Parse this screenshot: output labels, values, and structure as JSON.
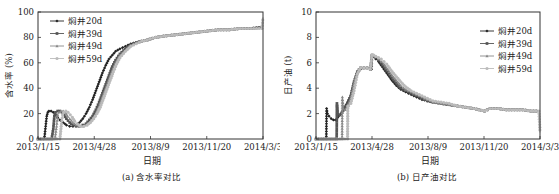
{
  "chart_data": [
    {
      "id": "a",
      "type": "line",
      "title": "(a) 含水率对比",
      "xlabel": "日期",
      "ylabel": "含水率 (%)",
      "x_ticks": [
        "2013/1/15",
        "2013/4/28",
        "2013/8/9",
        "2013/11/20",
        "2014/3/3"
      ],
      "x_tick_days": [
        0,
        103,
        206,
        309,
        412
      ],
      "xlim_days": [
        0,
        412
      ],
      "ylim": [
        0,
        100
      ],
      "y_ticks": [
        0,
        20,
        40,
        60,
        80,
        100
      ],
      "grid": false,
      "legend_position": "upper-left",
      "x_unit": "days since 2013/1/15",
      "series": [
        {
          "name": "焖井20d",
          "color": "#222222",
          "marker": "diamond",
          "x": [
            0,
            10,
            12,
            14,
            16,
            18,
            20,
            24,
            28,
            32,
            36,
            40,
            46,
            52,
            58,
            64,
            70,
            76,
            82,
            88,
            94,
            100,
            106,
            112,
            118,
            124,
            130,
            136,
            142,
            150,
            160,
            170,
            180,
            190,
            200,
            215,
            230,
            250,
            270,
            290,
            310,
            330,
            350,
            370,
            390,
            410
          ],
          "y": [
            0,
            0,
            2,
            10,
            18,
            21,
            22,
            22,
            21,
            19,
            17,
            15,
            13,
            11,
            10,
            10,
            11,
            13,
            16,
            20,
            25,
            31,
            38,
            45,
            52,
            58,
            63,
            66,
            69,
            71,
            73,
            75,
            76,
            77,
            78,
            80,
            81,
            82,
            83,
            84,
            85,
            86,
            86,
            87,
            87,
            88
          ]
        },
        {
          "name": "焖井39d",
          "color": "#555555",
          "marker": "square",
          "x": [
            0,
            25,
            28,
            30,
            32,
            36,
            40,
            44,
            48,
            52,
            58,
            64,
            70,
            76,
            82,
            88,
            94,
            100,
            106,
            112,
            118,
            124,
            130,
            136,
            142,
            150,
            160,
            170,
            180,
            190,
            200,
            215,
            230,
            250,
            270,
            290,
            310,
            330,
            350,
            370,
            390,
            410
          ],
          "y": [
            0,
            0,
            8,
            18,
            21,
            22,
            22,
            21,
            19,
            16,
            13,
            11,
            10,
            10,
            11,
            12,
            15,
            18,
            23,
            29,
            36,
            43,
            50,
            57,
            62,
            67,
            71,
            74,
            76,
            77,
            78,
            80,
            81,
            82,
            83,
            84,
            85,
            86,
            86,
            87,
            87,
            88
          ]
        },
        {
          "name": "焖井49d",
          "color": "#888888",
          "marker": "triangle",
          "x": [
            0,
            31,
            34,
            36,
            38,
            42,
            46,
            50,
            54,
            58,
            64,
            70,
            76,
            82,
            88,
            94,
            100,
            106,
            112,
            118,
            124,
            130,
            136,
            142,
            150,
            160,
            170,
            180,
            190,
            200,
            215,
            230,
            250,
            270,
            290,
            310,
            330,
            350,
            370,
            390,
            410
          ],
          "y": [
            0,
            0,
            10,
            19,
            21,
            22,
            22,
            21,
            18,
            16,
            13,
            11,
            10,
            10,
            11,
            13,
            16,
            20,
            26,
            33,
            40,
            47,
            54,
            60,
            66,
            70,
            74,
            76,
            77,
            78,
            80,
            81,
            82,
            83,
            84,
            85,
            86,
            86,
            87,
            87,
            88
          ]
        },
        {
          "name": "焖井59d",
          "color": "#bbbbbb",
          "marker": "circle",
          "x": [
            0,
            40,
            43,
            45,
            47,
            51,
            55,
            59,
            63,
            67,
            72,
            78,
            84,
            90,
            96,
            102,
            108,
            114,
            120,
            126,
            132,
            138,
            144,
            150,
            160,
            170,
            180,
            190,
            200,
            215,
            230,
            250,
            270,
            290,
            310,
            330,
            350,
            370,
            390,
            410,
            412
          ],
          "y": [
            0,
            0,
            12,
            19,
            21,
            22,
            21,
            19,
            17,
            14,
            12,
            10,
            10,
            11,
            13,
            16,
            20,
            25,
            32,
            39,
            46,
            53,
            59,
            64,
            69,
            73,
            75,
            77,
            78,
            80,
            81,
            82,
            83,
            84,
            85,
            86,
            86,
            87,
            87,
            87,
            96
          ]
        }
      ]
    },
    {
      "id": "b",
      "type": "line",
      "title": "(b) 日产油对比",
      "xlabel": "日期",
      "ylabel": "日产油 (t)",
      "x_ticks": [
        "2013/1/15",
        "2013/4/28",
        "2013/8/9",
        "2013/11/20",
        "2014/3/3"
      ],
      "x_tick_days": [
        0,
        103,
        206,
        309,
        412
      ],
      "xlim_days": [
        0,
        412
      ],
      "ylim": [
        0,
        10
      ],
      "y_ticks": [
        0,
        2,
        4,
        6,
        8,
        10
      ],
      "grid": false,
      "legend_position": "upper-right",
      "x_unit": "days since 2013/1/15",
      "series": [
        {
          "name": "焖井20d",
          "color": "#222222",
          "marker": "diamond",
          "x": [
            0,
            19,
            19.5,
            21,
            24,
            28,
            32,
            36,
            40,
            46,
            52,
            58,
            64,
            70,
            76,
            82,
            88,
            94,
            100,
            102,
            103,
            106,
            110,
            115,
            120,
            125,
            130,
            135,
            140,
            148,
            156,
            165,
            175,
            185,
            195,
            205,
            215,
            230,
            245,
            260,
            275,
            290,
            300,
            310,
            320,
            335,
            350,
            365,
            380,
            395,
            410
          ],
          "y": [
            0,
            0,
            2.4,
            2.0,
            1.8,
            1.6,
            1.5,
            1.5,
            1.7,
            2.0,
            2.4,
            2.9,
            3.4,
            4.4,
            5.2,
            5.5,
            5.6,
            5.6,
            5.5,
            5.5,
            6.6,
            6.5,
            6.3,
            6.1,
            5.8,
            5.5,
            5.2,
            4.9,
            4.6,
            4.2,
            3.9,
            3.7,
            3.5,
            3.3,
            3.1,
            3.0,
            2.9,
            2.8,
            2.7,
            2.6,
            2.5,
            2.4,
            2.3,
            2.2,
            2.4,
            2.4,
            2.3,
            2.3,
            2.3,
            2.2,
            2.2
          ]
        },
        {
          "name": "焖井39d",
          "color": "#555555",
          "marker": "square",
          "x": [
            0,
            38,
            38.5,
            40,
            44,
            48,
            52,
            58,
            64,
            70,
            76,
            82,
            88,
            94,
            100,
            103,
            106,
            110,
            115,
            120,
            125,
            130,
            135,
            140,
            148,
            156,
            165,
            175,
            185,
            195,
            205,
            215,
            230,
            245,
            260,
            275,
            290,
            300,
            310,
            320,
            335,
            350,
            365,
            380,
            395,
            410
          ],
          "y": [
            0,
            0,
            2.8,
            2.0,
            1.9,
            2.1,
            2.4,
            2.8,
            3.4,
            4.5,
            5.3,
            5.6,
            5.6,
            5.6,
            5.5,
            6.6,
            6.5,
            6.4,
            6.2,
            6.0,
            5.7,
            5.4,
            5.1,
            4.8,
            4.4,
            4.0,
            3.8,
            3.6,
            3.4,
            3.2,
            3.0,
            2.9,
            2.8,
            2.7,
            2.6,
            2.5,
            2.4,
            2.3,
            2.2,
            2.4,
            2.4,
            2.3,
            2.3,
            2.3,
            2.2,
            2.2
          ]
        },
        {
          "name": "焖井49d",
          "color": "#888888",
          "marker": "triangle",
          "x": [
            0,
            48,
            48.5,
            50,
            54,
            58,
            64,
            70,
            76,
            82,
            88,
            94,
            100,
            103,
            106,
            110,
            115,
            120,
            125,
            130,
            135,
            140,
            148,
            156,
            165,
            175,
            185,
            195,
            205,
            215,
            230,
            245,
            260,
            275,
            290,
            300,
            310,
            320,
            335,
            350,
            365,
            380,
            395,
            410
          ],
          "y": [
            0,
            0,
            3.3,
            2.4,
            2.3,
            2.6,
            3.2,
            4.4,
            5.3,
            5.6,
            5.6,
            5.6,
            5.5,
            6.6,
            6.6,
            6.5,
            6.3,
            6.1,
            5.9,
            5.6,
            5.3,
            5.0,
            4.6,
            4.2,
            3.9,
            3.7,
            3.5,
            3.3,
            3.1,
            2.9,
            2.8,
            2.7,
            2.6,
            2.5,
            2.4,
            2.3,
            2.2,
            2.4,
            2.4,
            2.3,
            2.3,
            2.3,
            2.2,
            2.2
          ]
        },
        {
          "name": "焖井59d",
          "color": "#bbbbbb",
          "marker": "circle",
          "x": [
            0,
            58,
            58.5,
            60,
            64,
            70,
            76,
            82,
            88,
            94,
            100,
            103,
            106,
            110,
            115,
            120,
            125,
            130,
            135,
            140,
            148,
            156,
            165,
            175,
            185,
            195,
            205,
            215,
            230,
            245,
            260,
            275,
            290,
            300,
            310,
            320,
            335,
            350,
            365,
            380,
            395,
            410,
            412
          ],
          "y": [
            0,
            0,
            2.6,
            2.6,
            2.8,
            3.8,
            5.1,
            5.6,
            5.6,
            5.6,
            5.5,
            6.6,
            6.6,
            6.5,
            6.4,
            6.3,
            6.1,
            5.9,
            5.6,
            5.3,
            4.9,
            4.5,
            4.1,
            3.8,
            3.6,
            3.4,
            3.2,
            3.0,
            2.9,
            2.8,
            2.6,
            2.5,
            2.4,
            2.3,
            2.2,
            2.4,
            2.4,
            2.3,
            2.3,
            2.3,
            2.2,
            2.2,
            0.5
          ]
        }
      ]
    }
  ],
  "panels": {
    "a": {
      "caption": "(a) 含水率对比",
      "xlabel": "日期",
      "ylabel": "含水率 (%)"
    },
    "b": {
      "caption": "(b) 日产油对比",
      "xlabel": "日期",
      "ylabel": "日产油 (t)"
    }
  }
}
